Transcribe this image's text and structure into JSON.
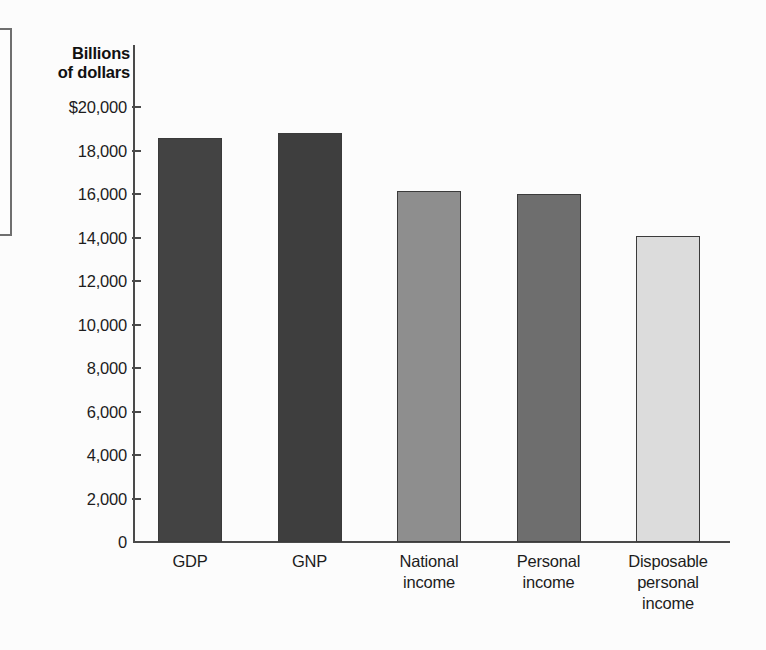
{
  "chart_data": {
    "type": "bar",
    "title": "",
    "axis_title": "Billions\nof dollars",
    "axis_title_line1": "Billions",
    "axis_title_line2": "of dollars",
    "xlabel": "",
    "ylabel": "Billions of dollars",
    "ylim": [
      0,
      20000
    ],
    "ytick_step": 2000,
    "grid": false,
    "legend": "none",
    "categories": [
      "GDP",
      "GNP",
      "National income",
      "Personal income",
      "Disposable personal income"
    ],
    "category_lines": [
      [
        "GDP"
      ],
      [
        "GNP"
      ],
      [
        "National",
        "income"
      ],
      [
        "Personal",
        "income"
      ],
      [
        "Disposable",
        "personal",
        "income"
      ]
    ],
    "values": [
      18570,
      18800,
      16140,
      16000,
      14070
    ],
    "ytick_labels": [
      "$20,000",
      "18,000",
      "16,000",
      "14,000",
      "12,000",
      "10,000",
      "8,000",
      "6,000",
      "4,000",
      "2,000",
      "0"
    ],
    "ytick_values": [
      20000,
      18000,
      16000,
      14000,
      12000,
      10000,
      8000,
      6000,
      4000,
      2000,
      0
    ],
    "bar_colors": [
      "#434343",
      "#3e3e3e",
      "#8e8e8e",
      "#6e6e6e",
      "#dcdcdc"
    ],
    "bar_border_color": "#3b3b3b",
    "axis_color": "#4a4a4a",
    "background_color": "#fcfcfc"
  }
}
